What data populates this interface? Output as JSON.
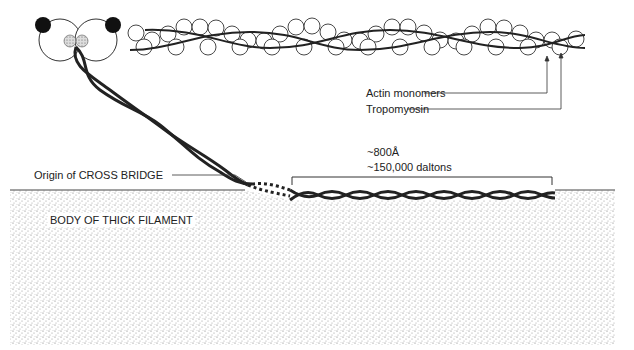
{
  "labels": {
    "actin": "Actin monomers",
    "tropomyosin": "Tropomyosin",
    "length": "~800Å",
    "mass": "~150,000 daltons",
    "origin": "Origin of CROSS BRIDGE",
    "body": "BODY OF THICK FILAMENT"
  },
  "colors": {
    "ink": "#222222",
    "stipple": "#9a9a9a"
  }
}
